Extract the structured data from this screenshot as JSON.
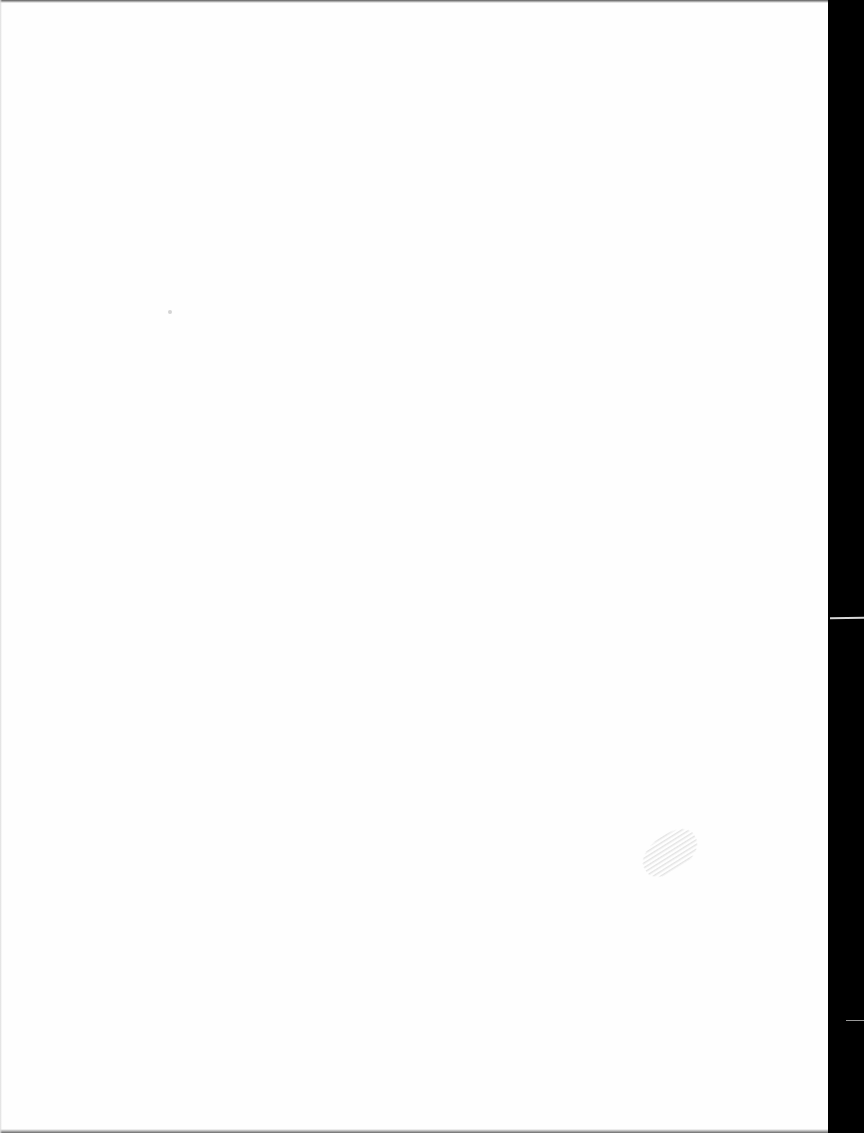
{
  "document": {
    "type": "scanned-page",
    "content": "",
    "is_blank": true
  },
  "artifacts": {
    "scanner_border_color": "#000000",
    "page_color": "#fefefe",
    "smudge_color": "#a0a0a0"
  }
}
